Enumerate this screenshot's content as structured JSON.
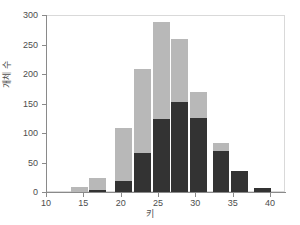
{
  "chart_data": {
    "type": "bar",
    "title": "",
    "subtitle": "",
    "xlabel": "키",
    "ylabel": "개체 수",
    "xlim": [
      10,
      42
    ],
    "ylim": [
      0,
      300
    ],
    "xticks": [
      10,
      15,
      20,
      25,
      30,
      35,
      40
    ],
    "yticks": [
      0,
      50,
      100,
      150,
      200,
      250,
      300
    ],
    "xtick_labels": [
      "10",
      "15",
      "20",
      "25",
      "30",
      "35",
      "40"
    ],
    "ytick_labels": [
      "0",
      "50",
      "100",
      "150",
      "200",
      "250",
      "300"
    ],
    "grid": false,
    "legend": "none",
    "stacked": true,
    "bar_width": 2.4,
    "categories": [
      14.5,
      17.0,
      20.5,
      23.0,
      25.5,
      28.0,
      30.5,
      33.5,
      36.0,
      39.0
    ],
    "series": [
      {
        "name": "lower",
        "color": "#333333",
        "values": [
          0,
          3,
          19,
          66,
          123,
          152,
          125,
          70,
          36,
          7
        ]
      },
      {
        "name": "upper",
        "color": "#b8b8b8",
        "values": [
          8,
          21,
          89,
          143,
          166,
          108,
          45,
          13,
          0,
          0
        ]
      }
    ],
    "totals": [
      8,
      24,
      108,
      209,
      289,
      260,
      170,
      83,
      36,
      7
    ],
    "colors": {
      "lower": "#333333",
      "upper": "#b8b8b8",
      "axis": "#8a8a8a",
      "frame": "#d9d9d9",
      "text": "#4d4d4d",
      "background": "#ffffff"
    }
  }
}
